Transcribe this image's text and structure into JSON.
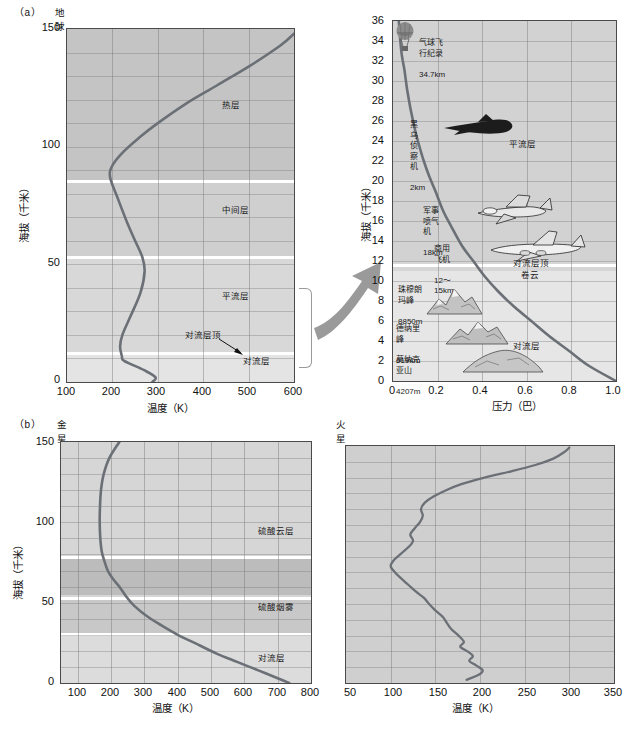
{
  "figure": {
    "panel_a_tag": "（a）",
    "panel_b_tag": "（b）",
    "earth_title": "地球",
    "venus_title": "金星",
    "mars_title": "火星"
  },
  "axis_labels": {
    "altitude_km": "海拔（千米）",
    "temperature_k": "温度（K）",
    "pressure_bar": "压力（巴）"
  },
  "earth_layers": {
    "thermosphere": "热层",
    "mesosphere": "中间层",
    "stratosphere": "平流层",
    "tropopause": "对流层顶",
    "troposphere": "对流层"
  },
  "venus_layers": {
    "sulfuric_cloud": "硫酸云层",
    "sulfuric_haze": "硫酸烟雾",
    "troposphere": "对流层"
  },
  "pressure_panel": {
    "layers": {
      "stratosphere": "平流层",
      "tropopause": "对流层顶",
      "cirrus": "卷云",
      "troposphere": "对流层"
    },
    "annotations": [
      {
        "name": "balloon-record",
        "label": "气球飞行纪录",
        "value": "34.7km"
      },
      {
        "name": "blackbird",
        "label": "黑乌侦察机",
        "value": "2km"
      },
      {
        "name": "military-jet",
        "label": "军事喷气机",
        "value": "18km"
      },
      {
        "name": "commercial-aircraft",
        "label": "商用飞机",
        "value": "12～15km"
      },
      {
        "name": "everest",
        "label": "珠穆朗玛峰",
        "value": "8850m"
      },
      {
        "name": "denali",
        "label": "德纳里峰",
        "value": "6194m"
      },
      {
        "name": "mauna-kea",
        "label": "莫纳克亚山",
        "value": "4207m"
      }
    ]
  },
  "chart_data": [
    {
      "name": "earth-temperature-profile",
      "type": "line",
      "title": "地球",
      "xlabel": "温度（K）",
      "ylabel": "海拔（千米）",
      "xlim": [
        100,
        600
      ],
      "ylim": [
        0,
        150
      ],
      "xticks": [
        100,
        200,
        300,
        400,
        500,
        600
      ],
      "yticks": [
        0,
        50,
        100,
        150
      ],
      "grid": true,
      "bands": [
        {
          "label": "对流层",
          "y0": 0,
          "y1": 12
        },
        {
          "label": "平流层",
          "y0": 12,
          "y1": 53
        },
        {
          "label": "中间层",
          "y0": 53,
          "y1": 85
        },
        {
          "label": "热层",
          "y0": 85,
          "y1": 150
        }
      ],
      "series": [
        {
          "name": "temperature",
          "x": [
            288,
            295,
            270,
            226,
            221,
            217,
            222,
            240,
            262,
            271,
            266,
            250,
            232,
            212,
            195,
            200,
            225,
            260,
            300,
            360,
            430,
            500,
            570,
            600
          ],
          "y": [
            0,
            2,
            5,
            9,
            11,
            15,
            20,
            28,
            38,
            47,
            53,
            60,
            68,
            78,
            87,
            92,
            98,
            104,
            110,
            118,
            126,
            134,
            143,
            148
          ]
        }
      ]
    },
    {
      "name": "earth-pressure-profile",
      "type": "line",
      "title": "",
      "xlabel": "压力（巴）",
      "ylabel": "海拔（千米）",
      "xlim": [
        0,
        1.0
      ],
      "ylim": [
        0,
        36
      ],
      "xticks": [
        0,
        0.2,
        0.4,
        0.6,
        0.8,
        1.0
      ],
      "yticks": [
        0,
        2,
        4,
        6,
        8,
        10,
        12,
        14,
        16,
        18,
        20,
        22,
        24,
        26,
        28,
        30,
        32,
        34,
        36
      ],
      "grid": true,
      "bands": [
        {
          "label": "对流层",
          "y0": 0,
          "y1": 11
        },
        {
          "label": "平流层",
          "y0": 12,
          "y1": 36
        }
      ],
      "series": [
        {
          "name": "pressure",
          "x": [
            1.0,
            0.88,
            0.79,
            0.7,
            0.62,
            0.54,
            0.47,
            0.41,
            0.36,
            0.31,
            0.26,
            0.225,
            0.19,
            0.162,
            0.138,
            0.118,
            0.1,
            0.085,
            0.072,
            0.061,
            0.052,
            0.044,
            0.037,
            0.031,
            0.026
          ],
          "y": [
            0,
            1.5,
            3,
            4.5,
            6,
            7.5,
            9,
            10.5,
            12,
            13.5,
            15.5,
            17,
            19,
            20.5,
            22,
            23.5,
            25,
            26.5,
            28,
            29.5,
            31,
            32,
            33,
            34.5,
            36
          ]
        }
      ]
    },
    {
      "name": "venus-temperature-profile",
      "type": "line",
      "title": "金星",
      "xlabel": "温度（K）",
      "ylabel": "海拔（千米）",
      "xlim": [
        50,
        800
      ],
      "ylim": [
        0,
        150
      ],
      "xticks": [
        100,
        200,
        300,
        400,
        500,
        600,
        700,
        800
      ],
      "yticks": [
        0,
        50,
        100,
        150
      ],
      "grid": true,
      "bands": [
        {
          "label": "对流层",
          "y0": 0,
          "y1": 30
        },
        {
          "label": "硫酸烟雾",
          "y0": 30,
          "y1": 52
        },
        {
          "label": "硫酸云层",
          "y0": 55,
          "y1": 78
        }
      ],
      "series": [
        {
          "name": "temperature",
          "x": [
            735,
            700,
            640,
            580,
            520,
            460,
            400,
            350,
            305,
            270,
            245,
            225,
            205,
            190,
            180,
            172,
            168,
            166,
            167,
            170,
            178,
            195,
            225
          ],
          "y": [
            0,
            3,
            8,
            13,
            18,
            24,
            30,
            36,
            42,
            48,
            54,
            60,
            65,
            70,
            76,
            82,
            90,
            100,
            110,
            120,
            130,
            140,
            150
          ]
        }
      ]
    },
    {
      "name": "mars-temperature-profile",
      "type": "line",
      "title": "火星",
      "xlabel": "温度（K）",
      "ylabel": "海拔（千米）",
      "xlim": [
        50,
        350
      ],
      "ylim": [
        0,
        150
      ],
      "xticks": [
        50,
        100,
        150,
        200,
        250,
        300,
        350
      ],
      "yticks": [],
      "grid": true,
      "bands": [],
      "series": [
        {
          "name": "temperature",
          "x": [
            185,
            198,
            203,
            196,
            188,
            192,
            186,
            178,
            182,
            176,
            168,
            163,
            158,
            150,
            143,
            137,
            128,
            120,
            112,
            105,
            100,
            104,
            112,
            120,
            125,
            122,
            127,
            133,
            136,
            134,
            138,
            148,
            162,
            180,
            205,
            235,
            262,
            282,
            294,
            300
          ],
          "y": [
            2,
            5,
            8,
            11,
            14,
            17,
            20,
            23,
            26,
            30,
            34,
            38,
            42,
            46,
            50,
            54,
            58,
            62,
            66,
            70,
            74,
            78,
            82,
            86,
            90,
            94,
            98,
            102,
            106,
            110,
            114,
            118,
            122,
            126,
            130,
            134,
            138,
            142,
            146,
            149
          ]
        }
      ]
    }
  ]
}
